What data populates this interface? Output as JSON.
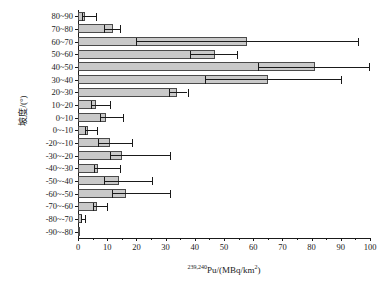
{
  "chart_data": {
    "type": "bar",
    "orientation": "horizontal",
    "title": "",
    "xlabel": "239,240Pu/(MBq/km2)",
    "xlabel_parts": {
      "superscript": "239,240",
      "base": "Pu/(MBq/km",
      "unit_superscript": "2",
      "tail": ")"
    },
    "ylabel": "坡度/(°)",
    "xlim": [
      0,
      100
    ],
    "xticks": [
      0,
      10,
      20,
      30,
      40,
      50,
      60,
      70,
      80,
      90,
      100
    ],
    "xticklabels": [
      "0",
      "10",
      "20",
      "30",
      "40",
      "50",
      "60",
      "70",
      "80",
      "90",
      "100"
    ],
    "grid": false,
    "legend": false,
    "bar_color": "#c9c9c9",
    "bar_edge_color": "#4a4a4a",
    "error_color": "#1a1a1a",
    "categories": [
      "80~90",
      "70~80",
      "60~70",
      "50~60",
      "40~50",
      "30~40",
      "20~30",
      "10~20",
      "0~10",
      "0~-10",
      "-20~-10",
      "-30~-20",
      "-40~-30",
      "-50~-40",
      "-60~-50",
      "-70~-60",
      "-80~-70",
      "-90~-80"
    ],
    "values": [
      2.5,
      12.0,
      58.0,
      47.0,
      81.0,
      65.0,
      34.0,
      6.0,
      9.5,
      3.5,
      11.0,
      15.0,
      7.0,
      14.0,
      16.5,
      6.5,
      1.5,
      0.6
    ],
    "error_low": [
      1.5,
      9.0,
      20.0,
      38.5,
      61.5,
      43.5,
      31.0,
      4.5,
      7.5,
      2.5,
      7.0,
      11.0,
      5.5,
      9.0,
      11.5,
      5.0,
      1.0,
      0.0
    ],
    "error_high": [
      6.0,
      14.5,
      96.0,
      54.5,
      99.5,
      90.0,
      37.5,
      11.0,
      15.5,
      6.5,
      18.5,
      31.5,
      14.5,
      25.5,
      31.5,
      10.0,
      2.5,
      0.0
    ]
  }
}
